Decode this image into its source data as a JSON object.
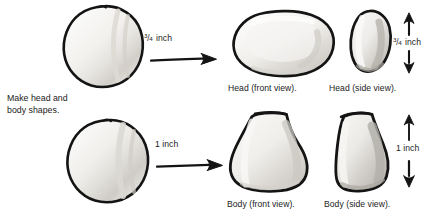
{
  "figure": {
    "kind": "instructional-craft-diagram",
    "title_text": null,
    "background_color": "#ffffff",
    "ink_color": "#141414",
    "clay_fill_light": "#f2f1ef",
    "clay_fill_mid": "#dedcd8",
    "clay_fill_shadow": "#c9c6c1"
  },
  "instruction": {
    "text": "Make head and\nbody shapes."
  },
  "rows": [
    {
      "id": "head-row",
      "start_shape_name": "clay-ball-head",
      "arrow_label": {
        "numerator": "3",
        "slash": "/",
        "denominator": "4",
        "unit": "inch",
        "full_text": "3/4 inch"
      },
      "results": [
        {
          "id": "head-front",
          "caption": "Head (front view)."
        },
        {
          "id": "head-side",
          "caption": "Head (side view)."
        }
      ],
      "dimension": {
        "numerator": "3",
        "slash": "/",
        "denominator": "4",
        "unit": "inch",
        "full_text": "3/4 inch",
        "orientation": "vertical-double-arrow"
      }
    },
    {
      "id": "body-row",
      "start_shape_name": "clay-ball-body",
      "arrow_label": {
        "numerator": null,
        "slash": null,
        "denominator": null,
        "unit": "inch",
        "full_text": "1 inch"
      },
      "results": [
        {
          "id": "body-front",
          "caption": "Body (front view)."
        },
        {
          "id": "body-side",
          "caption": "Body (side view)."
        }
      ],
      "dimension": {
        "full_text": "1 inch",
        "orientation": "vertical-double-arrow"
      }
    }
  ]
}
